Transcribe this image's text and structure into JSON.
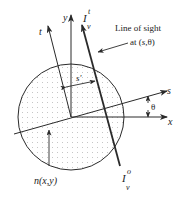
{
  "diagram": {
    "colors": {
      "stroke": "#2a2a2a",
      "fill_dots": "#9a9a9a",
      "background": "#ffffff"
    },
    "labels": {
      "y_axis": "y",
      "x_axis": "x",
      "s_axis": "s",
      "t_axis": "t",
      "s_prime": "s'",
      "theta": "θ",
      "intensity_top_base": "I",
      "intensity_top_sub": "ν",
      "intensity_top_sup": "t",
      "intensity_bottom_base": "I",
      "intensity_bottom_sub": "ν",
      "intensity_bottom_sup": "o",
      "line_of_sight_line1": "Line of sight",
      "line_of_sight_line2_pre": "at (",
      "line_of_sight_line2_s": "s",
      "line_of_sight_line2_post": ",θ)",
      "density": "n(x,y)"
    }
  }
}
